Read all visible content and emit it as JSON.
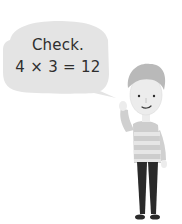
{
  "speech_bubble": {
    "line1": "Check.",
    "line2": "4 × 3 = 12",
    "fill_color": "#e4e4e4",
    "text_color": "#2e2e2e"
  },
  "character": {
    "description": "cartoon boy with striped sweater, raised hand",
    "hair_color": "#b9b9b9",
    "skin_color": "#ececec",
    "sweater_colors": [
      "#c8c8c8",
      "#e6e6e6"
    ],
    "pants_color": "#2a2a2a"
  }
}
